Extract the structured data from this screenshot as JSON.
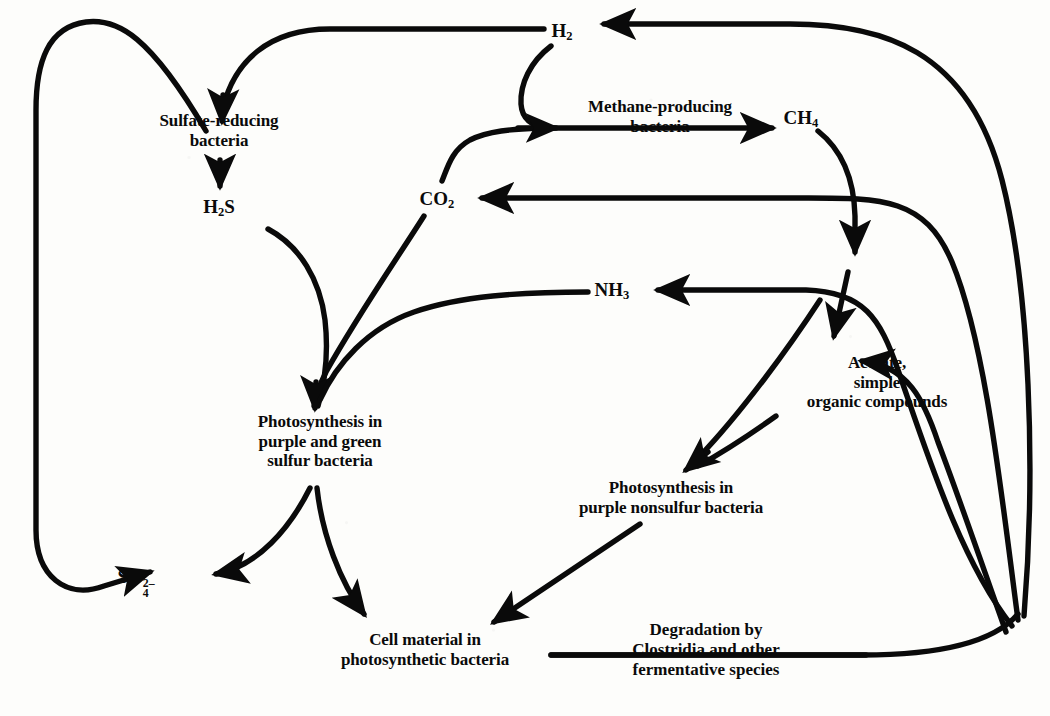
{
  "figure": {
    "type": "flow-diagram",
    "background_color": "#fdfdfb",
    "ink_color": "#0a0a0a",
    "width": 1050,
    "height": 716
  },
  "nodes": [
    {
      "id": "h2",
      "label": "H2",
      "html": "H<sub>2</sub>",
      "kind": "chemical",
      "x": 562,
      "y": 32
    },
    {
      "id": "ch4",
      "label": "CH4",
      "html": "CH<sub>4</sub>",
      "kind": "chemical",
      "x": 801,
      "y": 119
    },
    {
      "id": "co2",
      "label": "CO2",
      "html": "CO<sub>2</sub>",
      "kind": "chemical",
      "x": 437,
      "y": 200
    },
    {
      "id": "h2s",
      "label": "H2S",
      "html": "H<sub>2</sub>S",
      "kind": "chemical",
      "x": 219,
      "y": 208
    },
    {
      "id": "nh3",
      "label": "NH3",
      "html": "NH<sub>3</sub>",
      "kind": "chemical",
      "x": 612,
      "y": 291
    },
    {
      "id": "so4",
      "label": "SO4 2-",
      "html": "SO<span class=\"stack\"><sup>2–</sup><sub>4</sub></span>",
      "kind": "chemical",
      "x": 136,
      "y": 577
    },
    {
      "id": "sulfate-reducing-bacteria",
      "label": "Sulfate-reducing\nbacteria",
      "kind": "organism",
      "x": 219,
      "y": 131
    },
    {
      "id": "acetate",
      "label": "Acetate,\nsimple\norganic compounds",
      "kind": "substrate",
      "x": 877,
      "y": 383
    },
    {
      "id": "green-sulfur",
      "label": "Photosynthesis in\npurple and green\nsulfur bacteria",
      "kind": "organism",
      "x": 320,
      "y": 442
    },
    {
      "id": "nonsulfur",
      "label": "Photosynthesis in\npurple nonsulfur bacteria",
      "kind": "organism",
      "x": 671,
      "y": 498
    },
    {
      "id": "cell-material",
      "label": "Cell material in\nphotosynthetic bacteria",
      "kind": "product",
      "x": 425,
      "y": 650
    }
  ],
  "edge_labels": [
    {
      "id": "methane-producing-bacteria",
      "label": "Methane-producing\nbacteria",
      "x": 660,
      "y": 117
    },
    {
      "id": "degradation-clostridia",
      "label_pre": "Degradation by",
      "label_italic": "Clostridia",
      "label_post": " and other",
      "label_end": "fermentative species",
      "x": 706,
      "y": 650
    }
  ],
  "edges": [
    {
      "from": "so4",
      "to": "sulfate-reducing-bacteria",
      "via": "left-outer-loop"
    },
    {
      "from": "h2",
      "to": "sulfate-reducing-bacteria",
      "via": "top-arc"
    },
    {
      "from": "sulfate-reducing-bacteria",
      "to": "h2s",
      "via": "straight-down"
    },
    {
      "from": "h2",
      "to": "methane-producing-bacteria",
      "via": "down-curve"
    },
    {
      "from": "co2",
      "to": "methane-producing-bacteria",
      "via": "up-curve"
    },
    {
      "from": "methane-producing-bacteria",
      "to": "ch4",
      "via": "horizontal"
    },
    {
      "from": "ch4",
      "to": "acetate-hub",
      "via": "down-curve"
    },
    {
      "from": "h2s",
      "to": "green-sulfur",
      "via": "down-curve"
    },
    {
      "from": "co2",
      "to": "green-sulfur",
      "via": "down-left-curve"
    },
    {
      "from": "nh3",
      "to": "green-sulfur",
      "via": "long-left-curve"
    },
    {
      "from": "acetate-hub",
      "to": "nh3",
      "via": "left-arrow"
    },
    {
      "from": "acetate-hub",
      "to": "co2",
      "via": "long-left-arrow"
    },
    {
      "from": "acetate-hub",
      "to": "h2",
      "via": "right-outer-loop"
    },
    {
      "from": "acetate-hub",
      "to": "acetate",
      "via": "left-arrow-short"
    },
    {
      "from": "acetate",
      "to": "nonsulfur",
      "via": "down-left"
    },
    {
      "from": "nh3-area",
      "to": "nonsulfur",
      "via": "down-left"
    },
    {
      "from": "green-sulfur",
      "to": "so4",
      "via": "down-left-curve"
    },
    {
      "from": "green-sulfur",
      "to": "cell-material",
      "via": "down-right-curve"
    },
    {
      "from": "nonsulfur",
      "to": "cell-material",
      "via": "straight-down-left"
    },
    {
      "from": "degradation-clostridia",
      "to": "acetate-hub",
      "via": "bottom-right-curve"
    }
  ]
}
